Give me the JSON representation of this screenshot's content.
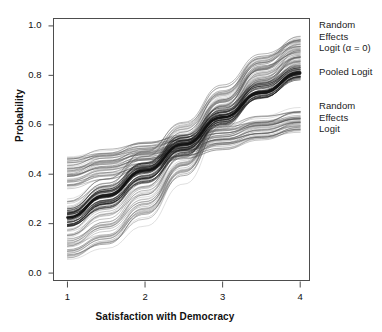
{
  "chart_data": {
    "type": "line",
    "title": "",
    "subtitle": "",
    "xlabel": "Satisfaction with Democracy",
    "ylabel": "Probability",
    "xlim": [
      0.82,
      4.12
    ],
    "ylim": [
      -0.03,
      1.03
    ],
    "xticks": [
      1,
      2,
      3,
      4
    ],
    "xtick_labels": [
      "1",
      "2",
      "3",
      "4"
    ],
    "yticks": [
      0.0,
      0.2,
      0.4,
      0.6,
      0.8,
      1.0
    ],
    "ytick_labels": [
      "0.0",
      "0.2",
      "0.4",
      "0.6",
      "0.8",
      "1.0"
    ],
    "grid": false,
    "legend_position": "right-outside",
    "x_domain_note": "curves drawn continuously from x=1 to x=4",
    "annotations": [
      {
        "text": "Random\nEffects\nLogit (α = 0)",
        "target_series": "random_effects_logit_alpha0",
        "position": "right-outside-top"
      },
      {
        "text": "Pooled Logit",
        "target_series": "pooled_logit",
        "position": "right-outside-upper-middle"
      },
      {
        "text": "Random\nEffects\nLogit",
        "target_series": "random_effects_logit",
        "position": "right-outside-middle"
      }
    ],
    "series": [
      {
        "name": "pooled_logit",
        "label": "Pooled Logit",
        "style": "thick-dark",
        "color": "#111111",
        "linewidth": 2.6,
        "x": [
          1,
          1.5,
          2,
          2.5,
          3,
          3.5,
          4
        ],
        "values": [
          0.225,
          0.315,
          0.415,
          0.52,
          0.63,
          0.73,
          0.81
        ]
      },
      {
        "name": "random_effects_logit_alpha0",
        "label": "Random Effects Logit (α = 0)",
        "style": "bundle-light",
        "color": "#555555",
        "linewidth": 0.55,
        "bundle_count": 60,
        "x": [
          1,
          1.5,
          2,
          2.5,
          3,
          3.5,
          4
        ],
        "bundle_lower": [
          0.055,
          0.115,
          0.225,
          0.4,
          0.6,
          0.75,
          0.845
        ],
        "bundle_upper": [
          0.285,
          0.375,
          0.485,
          0.6,
          0.745,
          0.875,
          0.945
        ],
        "bundle_mean": [
          0.175,
          0.245,
          0.355,
          0.5,
          0.675,
          0.815,
          0.9
        ]
      },
      {
        "name": "random_effects_logit",
        "label": "Random Effects Logit",
        "style": "bundle-light-shallow",
        "color": "#4a4a4a",
        "linewidth": 0.55,
        "bundle_count": 40,
        "x": [
          1,
          1.5,
          2,
          2.5,
          3,
          3.5,
          4
        ],
        "bundle_lower": [
          0.345,
          0.385,
          0.425,
          0.465,
          0.505,
          0.545,
          0.575
        ],
        "bundle_upper": [
          0.465,
          0.495,
          0.525,
          0.555,
          0.59,
          0.625,
          0.655
        ],
        "bundle_mean": [
          0.405,
          0.44,
          0.475,
          0.51,
          0.548,
          0.585,
          0.615
        ]
      },
      {
        "name": "random_effects_logit_dark_core",
        "label": "Random Effects Logit (dense core)",
        "style": "bundle-dark-core",
        "color": "#1c1c1c",
        "linewidth": 0.7,
        "bundle_count": 26,
        "x": [
          1,
          1.5,
          2,
          2.5,
          3,
          3.5,
          4
        ],
        "bundle_lower": [
          0.185,
          0.265,
          0.365,
          0.48,
          0.6,
          0.705,
          0.785
        ],
        "bundle_upper": [
          0.26,
          0.345,
          0.445,
          0.555,
          0.665,
          0.765,
          0.835
        ],
        "bundle_mean": [
          0.222,
          0.305,
          0.405,
          0.518,
          0.632,
          0.735,
          0.81
        ]
      }
    ]
  },
  "axis": {
    "x": {
      "title": "Satisfaction with Democracy",
      "ticks": [
        {
          "value": 1,
          "label": "1"
        },
        {
          "value": 2,
          "label": "2"
        },
        {
          "value": 3,
          "label": "3"
        },
        {
          "value": 4,
          "label": "4"
        }
      ]
    },
    "y": {
      "title": "Probability",
      "ticks": [
        {
          "value": 0.0,
          "label": "0.0"
        },
        {
          "value": 0.2,
          "label": "0.2"
        },
        {
          "value": 0.4,
          "label": "0.4"
        },
        {
          "value": 0.6,
          "label": "0.6"
        },
        {
          "value": 0.8,
          "label": "0.8"
        },
        {
          "value": 1.0,
          "label": "1.0"
        }
      ]
    }
  },
  "legend": {
    "random_effects_alpha": {
      "line1": "Random",
      "line2": "Effects",
      "line3": "Logit (α = 0)"
    },
    "pooled_logit": {
      "line1": "Pooled Logit"
    },
    "random_effects": {
      "line1": "Random",
      "line2": "Effects",
      "line3": "Logit"
    }
  },
  "colors": {
    "frame": "#4d4d4d",
    "text": "#111111",
    "curve_dark": "#111111",
    "curve_light": "#555555",
    "background": "#ffffff"
  }
}
